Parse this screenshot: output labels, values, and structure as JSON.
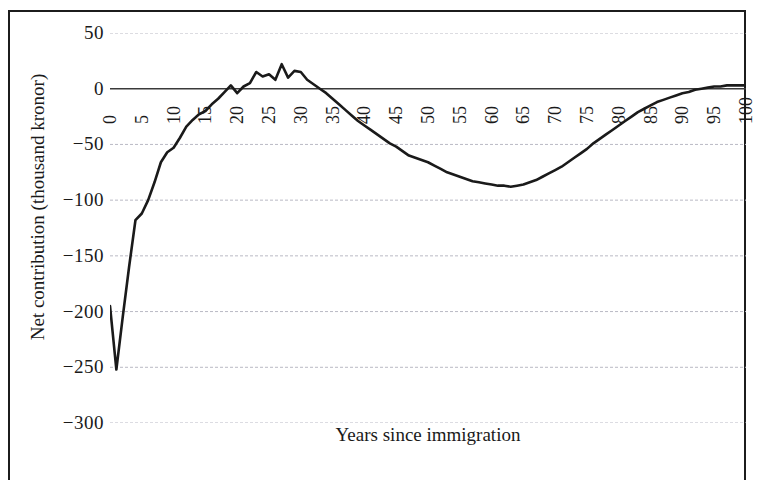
{
  "figure": {
    "background_color": "#ffffff",
    "border_color": "#1c1c1c",
    "line_color": "#1a1a1a",
    "gridline_color": "#b9b9c4",
    "axis_line_color": "#3a3a3a"
  },
  "chart_data": {
    "type": "line",
    "title": "",
    "xlabel": "Years since immigration",
    "ylabel": "Net contribution (thousand kronor)",
    "xlim": [
      0,
      100
    ],
    "ylim": [
      -300,
      50
    ],
    "ytick_values": [
      50,
      0,
      -50,
      -100,
      -150,
      -200,
      -250,
      -300
    ],
    "ytick_labels": [
      "50",
      "0",
      "−50",
      "−100",
      "−150",
      "−200",
      "−250",
      "−300"
    ],
    "xtick_values": [
      0,
      5,
      10,
      15,
      20,
      25,
      30,
      35,
      40,
      45,
      50,
      55,
      60,
      65,
      70,
      75,
      80,
      85,
      90,
      95,
      100
    ],
    "xtick_labels": [
      "0",
      "5",
      "10",
      "15",
      "20",
      "25",
      "30",
      "35",
      "40",
      "45",
      "50",
      "55",
      "60",
      "65",
      "70",
      "75",
      "80",
      "85",
      "90",
      "95",
      "100"
    ],
    "xtick_rotation": 90,
    "grid": true,
    "grid_axis": "y",
    "legend": false,
    "series": [
      {
        "name": "Net contribution",
        "x": [
          0,
          1,
          2,
          3,
          4,
          5,
          6,
          7,
          8,
          9,
          10,
          11,
          12,
          13,
          14,
          15,
          16,
          17,
          18,
          19,
          20,
          21,
          22,
          23,
          24,
          25,
          26,
          27,
          28,
          29,
          30,
          31,
          32,
          33,
          34,
          35,
          36,
          37,
          38,
          39,
          40,
          41,
          42,
          43,
          44,
          45,
          46,
          47,
          48,
          49,
          50,
          51,
          52,
          53,
          54,
          55,
          56,
          57,
          58,
          59,
          60,
          61,
          62,
          63,
          64,
          65,
          66,
          67,
          68,
          69,
          70,
          71,
          72,
          73,
          74,
          75,
          76,
          77,
          78,
          79,
          80,
          81,
          82,
          83,
          84,
          85,
          86,
          87,
          88,
          89,
          90,
          91,
          92,
          93,
          94,
          95,
          96,
          97,
          98,
          99,
          100
        ],
        "y": [
          -195,
          -252,
          -205,
          -160,
          -118,
          -112,
          -100,
          -84,
          -66,
          -57,
          -53,
          -44,
          -34,
          -28,
          -23,
          -20,
          -14,
          -9,
          -3,
          3,
          -4,
          2,
          5,
          15,
          11,
          13,
          8,
          22,
          10,
          16,
          15,
          8,
          4,
          0,
          -4,
          -9,
          -14,
          -19,
          -24,
          -29,
          -33,
          -37,
          -41,
          -45,
          -49,
          -52,
          -56,
          -60,
          -62,
          -64,
          -66,
          -69,
          -72,
          -75,
          -77,
          -79,
          -81,
          -83,
          -84,
          -85,
          -86,
          -87,
          -87,
          -88,
          -87,
          -86,
          -84,
          -82,
          -79,
          -76,
          -73,
          -70,
          -66,
          -62,
          -58,
          -54,
          -49,
          -45,
          -41,
          -37,
          -33,
          -29,
          -25,
          -21,
          -18,
          -15,
          -12,
          -10,
          -8,
          -6,
          -4,
          -3,
          -1,
          0,
          1,
          2,
          2,
          3,
          3,
          3,
          3
        ]
      }
    ]
  }
}
